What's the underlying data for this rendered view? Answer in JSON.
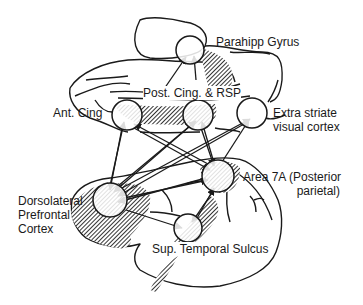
{
  "diagram": {
    "type": "brain-network",
    "colors": {
      "stroke": "#1a1a1a",
      "hatch": "#3a3a3a",
      "background": "#ffffff",
      "node_fill": "#ffffff"
    },
    "nodes": [
      {
        "id": "parahipp",
        "label": "Parahipp Gyrus",
        "cx": 190,
        "cy": 50,
        "r": 14
      },
      {
        "id": "post_cing",
        "label": "Post. Cing. & RSP",
        "cx": 198,
        "cy": 115,
        "r": 15
      },
      {
        "id": "ant_cing",
        "label": "Ant. Cing",
        "cx": 127,
        "cy": 115,
        "r": 15
      },
      {
        "id": "extrastriate",
        "label": "Extra striate visual cortex",
        "cx": 252,
        "cy": 113,
        "r": 15
      },
      {
        "id": "area7a",
        "label": "Area 7A (Posterior parietal)",
        "cx": 218,
        "cy": 176,
        "r": 16
      },
      {
        "id": "dlpfc",
        "label": "Dorsolateral Prefrontal Cortex",
        "cx": 110,
        "cy": 200,
        "r": 17
      },
      {
        "id": "sts",
        "label": "Sup. Temporal Sulcus",
        "cx": 188,
        "cy": 228,
        "r": 14
      }
    ],
    "edges": [
      {
        "from": "dlpfc",
        "to": "parahipp"
      },
      {
        "from": "area7a",
        "to": "parahipp"
      },
      {
        "from": "dlpfc",
        "to": "ant_cing"
      },
      {
        "from": "dlpfc",
        "to": "post_cing"
      },
      {
        "from": "dlpfc",
        "to": "extrastriate"
      },
      {
        "from": "area7a",
        "to": "ant_cing"
      },
      {
        "from": "area7a",
        "to": "post_cing"
      },
      {
        "from": "area7a",
        "to": "extrastriate"
      },
      {
        "from": "ant_cing",
        "to": "area7a"
      },
      {
        "from": "post_cing",
        "to": "area7a"
      },
      {
        "from": "extrastriate",
        "to": "dlpfc"
      },
      {
        "from": "ant_cing",
        "to": "dlpfc"
      },
      {
        "from": "post_cing",
        "to": "dlpfc"
      },
      {
        "from": "area7a",
        "to": "dlpfc"
      },
      {
        "from": "dlpfc",
        "to": "area7a"
      },
      {
        "from": "dlpfc",
        "to": "sts"
      },
      {
        "from": "area7a",
        "to": "sts"
      },
      {
        "from": "sts",
        "to": "area7a"
      }
    ]
  },
  "labels": {
    "parahipp": "Parahipp Gyrus",
    "post_cing": "Post. Cing. & RSP",
    "ant_cing": "Ant. Cing",
    "extrastriate_1": "Extra striate",
    "extrastriate_2": "visual cortex",
    "area7a_1": "Area 7A (Posterior",
    "area7a_2": "parietal)",
    "dlpfc_1": "Dorsolateral",
    "dlpfc_2": "Prefrontal",
    "dlpfc_3": "Cortex",
    "sts": "Sup. Temporal Sulcus"
  }
}
